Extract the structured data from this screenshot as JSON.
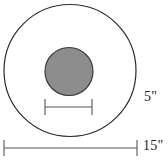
{
  "figure": {
    "background_color": "#ffffff"
  },
  "shapes": {
    "outer_circle": {
      "name": "outer-circle",
      "cx": 70,
      "cy": 70.5,
      "r": 66,
      "fill": "none",
      "stroke": "#2b2b2b",
      "stroke_width": 1.2
    },
    "inner_circle": {
      "name": "inner-circle",
      "cx": 69,
      "cy": 71.5,
      "r": 24,
      "fill": "#8d8d8d",
      "stroke": "#3a3a3a",
      "stroke_width": 1.2
    }
  },
  "dimensions": [
    {
      "id": "inner-diameter",
      "label": "5\"",
      "value": 5,
      "unit": "inch",
      "measures": "inner circle diameter",
      "line": {
        "x1": 45,
        "x2": 92,
        "y": 107
      },
      "tick_half_height": 8,
      "stroke": "#555555",
      "label_position": {
        "x": 144,
        "y": 90
      }
    },
    {
      "id": "outer-diameter",
      "label": "15\"",
      "value": 15,
      "unit": "inch",
      "measures": "outer circle diameter",
      "line": {
        "x1": 4,
        "x2": 137,
        "y": 148
      },
      "tick_half_height": 8,
      "stroke": "#555555",
      "label_position": {
        "x": 143,
        "y": 139
      }
    }
  ],
  "colors": {
    "outline": "#2b2b2b",
    "fill_gray": "#8d8d8d",
    "dimension_line": "#555555",
    "text": "#222222"
  }
}
